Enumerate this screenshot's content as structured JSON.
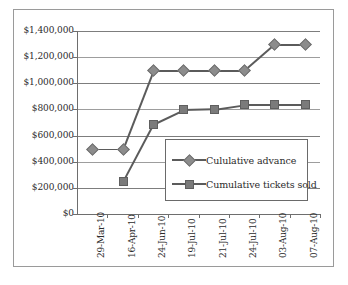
{
  "chart_data": {
    "type": "line",
    "title": "",
    "xlabel": "",
    "ylabel": "",
    "grid": true,
    "legend_position": "inside-right",
    "categories": [
      "29-Mar-10",
      "16-Apr-10",
      "24-Jun-10",
      "19-Jul-10",
      "21-Jul-10",
      "24-Jul-10",
      "03-Aug-10",
      "07-Aug-10"
    ],
    "ylim": [
      0,
      1400000
    ],
    "ytick_labels": [
      "$1,400,000",
      "$1,200,000",
      "$1,000,000",
      "$800,000",
      "$600,000",
      "$400,000",
      "$200,000",
      "$0"
    ],
    "ytick_values": [
      1400000,
      1200000,
      1000000,
      800000,
      600000,
      400000,
      200000,
      0
    ],
    "series": [
      {
        "name": "Cululative advance",
        "marker": "diamond",
        "color": "#8c8c8c",
        "line_color": "#5b5b5b",
        "values": [
          500000,
          500000,
          1100000,
          1100000,
          1100000,
          1100000,
          1300000,
          1300000
        ]
      },
      {
        "name": "Cumulative tickets sold",
        "marker": "square",
        "color": "#7b7b7b",
        "line_color": "#5b5b5b",
        "values": [
          null,
          250000,
          690000,
          800000,
          805000,
          840000,
          840000,
          840000
        ]
      }
    ]
  },
  "legend": {
    "items": [
      {
        "label": "Cululative advance"
      },
      {
        "label": "Cumulative tickets sold"
      }
    ]
  }
}
